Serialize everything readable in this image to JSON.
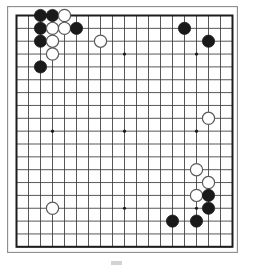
{
  "figure": {
    "kind": "go-board-diagram",
    "game": "Go",
    "board_size": 19,
    "colors": {
      "board_background": "#ffffff",
      "grid_line": "#3a3a3a",
      "border_line": "#1c1c1c",
      "black_stone": "#1a1a1a",
      "white_stone_fill": "#ffffff",
      "white_stone_edge": "#5a5a5a",
      "star_point": "#1a1a1a"
    },
    "geometry": {
      "board_left": 7,
      "board_top": 6,
      "board_width": 231,
      "board_height": 247,
      "cell_width": 12.0,
      "cell_height": 12.85,
      "margin_x": 9.5,
      "margin_y": 9.5,
      "stone_radius": 6.1,
      "star_radius": 1.6
    },
    "star_points": [
      {
        "col": 4,
        "row": 4
      },
      {
        "col": 10,
        "row": 4
      },
      {
        "col": 16,
        "row": 4
      },
      {
        "col": 4,
        "row": 10
      },
      {
        "col": 10,
        "row": 10
      },
      {
        "col": 16,
        "row": 10
      },
      {
        "col": 4,
        "row": 16
      },
      {
        "col": 10,
        "row": 16
      },
      {
        "col": 16,
        "row": 16
      }
    ],
    "stones": [
      {
        "col": 3,
        "row": 1,
        "color": "black"
      },
      {
        "col": 4,
        "row": 1,
        "color": "black"
      },
      {
        "col": 5,
        "row": 1,
        "color": "white"
      },
      {
        "col": 3,
        "row": 2,
        "color": "black"
      },
      {
        "col": 4,
        "row": 2,
        "color": "white"
      },
      {
        "col": 5,
        "row": 2,
        "color": "white"
      },
      {
        "col": 6,
        "row": 2,
        "color": "black"
      },
      {
        "col": 3,
        "row": 3,
        "color": "black"
      },
      {
        "col": 4,
        "row": 3,
        "color": "white"
      },
      {
        "col": 4,
        "row": 4,
        "color": "white"
      },
      {
        "col": 3,
        "row": 5,
        "color": "black"
      },
      {
        "col": 8,
        "row": 3,
        "color": "white"
      },
      {
        "col": 15,
        "row": 2,
        "color": "black"
      },
      {
        "col": 17,
        "row": 3,
        "color": "black"
      },
      {
        "col": 17,
        "row": 9,
        "color": "white"
      },
      {
        "col": 16,
        "row": 13,
        "color": "white"
      },
      {
        "col": 17,
        "row": 14,
        "color": "white"
      },
      {
        "col": 16,
        "row": 15,
        "color": "white"
      },
      {
        "col": 17,
        "row": 15,
        "color": "black"
      },
      {
        "col": 17,
        "row": 16,
        "color": "black"
      },
      {
        "col": 4,
        "row": 16,
        "color": "white"
      },
      {
        "col": 14,
        "row": 17,
        "color": "black"
      },
      {
        "col": 16,
        "row": 17,
        "color": "black"
      }
    ],
    "counts": {
      "black_stones": 12,
      "white_stones": 11,
      "total_stones": 23
    }
  },
  "caption": {
    "marker": "",
    "text": ""
  }
}
